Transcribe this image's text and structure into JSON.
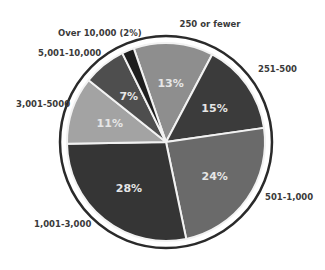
{
  "chart_data": {
    "type": "pie",
    "title": "",
    "start_angle_deg": -19,
    "direction": "clockwise",
    "slices": [
      {
        "label": "250 or fewer",
        "value": 13,
        "value_label": "13%",
        "color": "#8e8e8e",
        "show_value": true
      },
      {
        "label": "251-500",
        "value": 15,
        "value_label": "15%",
        "color": "#3b3b3b",
        "show_value": true
      },
      {
        "label": "501-1,000",
        "value": 24,
        "value_label": "24%",
        "color": "#6a6a6a",
        "show_value": true
      },
      {
        "label": "1,001-3,000",
        "value": 28,
        "value_label": "28%",
        "color": "#353535",
        "show_value": true
      },
      {
        "label": "3,001-5000",
        "value": 11,
        "value_label": "11%",
        "color": "#a3a3a3",
        "show_value": true
      },
      {
        "label": "5,001-10,000",
        "value": 7,
        "value_label": "7%",
        "color": "#4e4e4e",
        "show_value": true
      },
      {
        "label": "Over 10,000 (2%)",
        "value": 2,
        "value_label": "2%",
        "color": "#1e1e1e",
        "show_value": false
      }
    ],
    "ring_color": "#2a2a2a",
    "separator_color": "#f2f2f2",
    "label_color": "#3a3a3a",
    "value_text_color": "#e6e6e6"
  }
}
